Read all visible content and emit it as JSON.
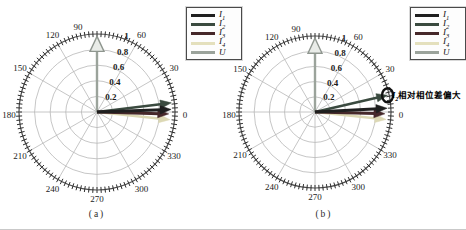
{
  "page": {
    "background": "#ffffff"
  },
  "colors": {
    "grid": "#b8b8b8",
    "outer_ring": "#4d4d4d",
    "tick": "#2e2e2e",
    "label": "#1a1a1a",
    "annotation_circle": "#111111"
  },
  "legend": {
    "entries": [
      {
        "base": "I",
        "sub": "1",
        "color": "#1f1f1f"
      },
      {
        "base": "I",
        "sub": "2",
        "color": "#3a4a3f"
      },
      {
        "base": "I",
        "sub": "3",
        "color": "#46282a"
      },
      {
        "base": "I",
        "sub": "4",
        "color": "#e4e0bd"
      },
      {
        "base": "U",
        "sub": "",
        "color": "#9ba39b"
      }
    ]
  },
  "chart_data": [
    {
      "id": "a",
      "type": "polar-vector",
      "caption": "(a)",
      "rlim": [
        0,
        1
      ],
      "grid": {
        "spoke_step_deg": 30,
        "tick_step_deg": 3,
        "ring_values": [
          0.2,
          0.4,
          0.6,
          0.8,
          1.0
        ]
      },
      "angle_labels": [
        0,
        30,
        60,
        90,
        120,
        150,
        180,
        210,
        240,
        270,
        300,
        330
      ],
      "radius_labels": [
        "0.2",
        "0.4",
        "0.6",
        "0.8",
        "1"
      ],
      "vectors": [
        {
          "name": "U",
          "angle_deg": 90,
          "length": 0.97,
          "color": "#9ba39b",
          "width": 2.4,
          "head": "hollow"
        },
        {
          "name": "I4",
          "angle_deg": -6,
          "length": 0.94,
          "color": "#dcd8b4",
          "width": 2.4,
          "head": "filled"
        },
        {
          "name": "I2",
          "angle_deg": 7,
          "length": 0.96,
          "color": "#3a4a3f",
          "width": 2.4,
          "head": "filled"
        },
        {
          "name": "I3",
          "angle_deg": -1.5,
          "length": 0.92,
          "color": "#46282a",
          "width": 3.0,
          "head": "filled"
        },
        {
          "name": "I1",
          "angle_deg": 2,
          "length": 0.95,
          "color": "#1f1f1f",
          "width": 3.0,
          "head": "filled"
        }
      ],
      "annotation": null
    },
    {
      "id": "b",
      "type": "polar-vector",
      "caption": "(b)",
      "rlim": [
        0,
        1
      ],
      "grid": {
        "spoke_step_deg": 30,
        "tick_step_deg": 3,
        "ring_values": [
          0.2,
          0.4,
          0.6,
          0.8,
          1.0
        ]
      },
      "angle_labels": [
        0,
        30,
        60,
        90,
        120,
        150,
        180,
        210,
        240,
        270,
        300,
        330
      ],
      "radius_labels": [
        "0.2",
        "0.4",
        "0.6",
        "0.8",
        "1"
      ],
      "vectors": [
        {
          "name": "U",
          "angle_deg": 90,
          "length": 0.97,
          "color": "#9ba39b",
          "width": 2.4,
          "head": "hollow"
        },
        {
          "name": "I4",
          "angle_deg": -6,
          "length": 0.94,
          "color": "#dcd8b4",
          "width": 2.4,
          "head": "filled"
        },
        {
          "name": "I2",
          "angle_deg": 13,
          "length": 0.98,
          "color": "#3a4a3f",
          "width": 2.4,
          "head": "filled"
        },
        {
          "name": "I3",
          "angle_deg": -1.5,
          "length": 0.92,
          "color": "#46282a",
          "width": 3.0,
          "head": "filled"
        },
        {
          "name": "I1",
          "angle_deg": 3,
          "length": 0.95,
          "color": "#1f1f1f",
          "width": 3.0,
          "head": "filled"
        }
      ],
      "annotation": {
        "var_italic": "I",
        "var_sub": "2",
        "text": "相对相位差偏大",
        "circle_angle_deg": 13,
        "circle_r": 0.98
      }
    }
  ]
}
